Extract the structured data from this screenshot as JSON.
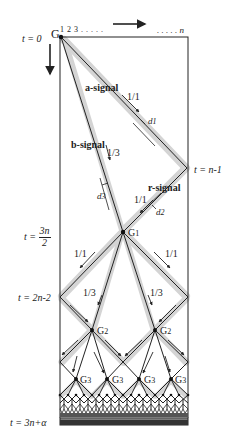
{
  "diagram": {
    "type": "space-time diagram",
    "colors": {
      "line": "#222222",
      "shade": "#d4d4d4",
      "background": "#ffffff"
    },
    "top_axis": {
      "origin_label": "G",
      "cell_labels": "1 2 3 . . . . .",
      "end_label": ". . . . . n",
      "direction": "space-arrow-right"
    },
    "time_axis": {
      "direction": "time-arrow-down"
    },
    "time_labels": [
      {
        "id": "t0",
        "text": "t = 0"
      },
      {
        "id": "tn1",
        "text": "t = n-1"
      },
      {
        "id": "t3n2",
        "prefix": "t = ",
        "num": "3n",
        "den": "2"
      },
      {
        "id": "t2n2",
        "text": "t = 2n-2"
      },
      {
        "id": "t3na",
        "text": "t = 3n+α"
      }
    ],
    "signals": {
      "a_signal": "a-signal",
      "b_signal": "b-signal",
      "r_signal": "r-signal"
    },
    "speeds": {
      "a": "1/1",
      "b": "1/3",
      "r": "1/1",
      "g1_left": "1/1",
      "g1_right": "1/1",
      "g1_inner_left": "1/3",
      "g1_inner_right": "1/3"
    },
    "delays": {
      "d1": "d",
      "d1_sub": "1",
      "d2": "d",
      "d2_sub": "2",
      "d3": "d",
      "d3_sub": "3"
    },
    "generals": {
      "g1": "G",
      "g1_sub": "1",
      "g2": "G",
      "g2_sub": "2",
      "g3": "G",
      "g3_sub": "3"
    }
  }
}
